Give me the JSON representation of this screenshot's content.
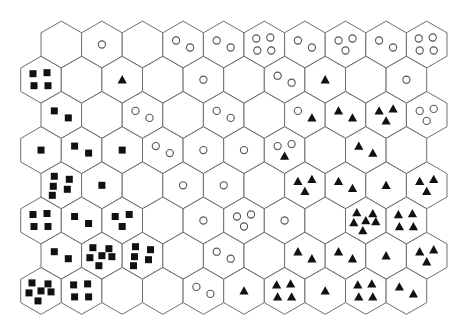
{
  "figure": {
    "type": "hexagonal-som-grid",
    "rows": 8,
    "cols": 10,
    "legend": {
      "square": "class-square",
      "circle": "class-circle",
      "triangle": "class-triangle"
    },
    "colors": {
      "background": "#ffffff",
      "hex_stroke": "#6e6e6e",
      "filled_marker": "#111111",
      "circle_stroke": "#555555"
    },
    "cells": [
      [
        {
          "square": 0,
          "circle": 0,
          "triangle": 0
        },
        {
          "square": 0,
          "circle": 1,
          "triangle": 0
        },
        {
          "square": 0,
          "circle": 0,
          "triangle": 0
        },
        {
          "square": 0,
          "circle": 2,
          "triangle": 0
        },
        {
          "square": 0,
          "circle": 2,
          "triangle": 0
        },
        {
          "square": 0,
          "circle": 4,
          "triangle": 0
        },
        {
          "square": 0,
          "circle": 2,
          "triangle": 0
        },
        {
          "square": 0,
          "circle": 3,
          "triangle": 0
        },
        {
          "square": 0,
          "circle": 2,
          "triangle": 0
        },
        {
          "square": 0,
          "circle": 4,
          "triangle": 0
        }
      ],
      [
        {
          "square": 4,
          "circle": 0,
          "triangle": 0
        },
        {
          "square": 0,
          "circle": 0,
          "triangle": 0
        },
        {
          "square": 0,
          "circle": 0,
          "triangle": 1
        },
        {
          "square": 0,
          "circle": 0,
          "triangle": 0
        },
        {
          "square": 0,
          "circle": 1,
          "triangle": 0
        },
        {
          "square": 0,
          "circle": 0,
          "triangle": 0
        },
        {
          "square": 0,
          "circle": 2,
          "triangle": 0
        },
        {
          "square": 0,
          "circle": 0,
          "triangle": 1
        },
        {
          "square": 0,
          "circle": 0,
          "triangle": 0
        },
        {
          "square": 0,
          "circle": 1,
          "triangle": 0
        }
      ],
      [
        {
          "square": 2,
          "circle": 0,
          "triangle": 0
        },
        {
          "square": 0,
          "circle": 0,
          "triangle": 0
        },
        {
          "square": 0,
          "circle": 2,
          "triangle": 0
        },
        {
          "square": 0,
          "circle": 0,
          "triangle": 0
        },
        {
          "square": 0,
          "circle": 2,
          "triangle": 0
        },
        {
          "square": 0,
          "circle": 0,
          "triangle": 0
        },
        {
          "square": 0,
          "circle": 1,
          "triangle": 1
        },
        {
          "square": 0,
          "circle": 0,
          "triangle": 2
        },
        {
          "square": 0,
          "circle": 0,
          "triangle": 3
        },
        {
          "square": 0,
          "circle": 3,
          "triangle": 0
        }
      ],
      [
        {
          "square": 1,
          "circle": 0,
          "triangle": 0
        },
        {
          "square": 2,
          "circle": 0,
          "triangle": 0
        },
        {
          "square": 1,
          "circle": 0,
          "triangle": 0
        },
        {
          "square": 0,
          "circle": 2,
          "triangle": 0
        },
        {
          "square": 0,
          "circle": 1,
          "triangle": 0
        },
        {
          "square": 0,
          "circle": 1,
          "triangle": 0
        },
        {
          "square": 0,
          "circle": 2,
          "triangle": 1
        },
        {
          "square": 0,
          "circle": 0,
          "triangle": 0
        },
        {
          "square": 0,
          "circle": 0,
          "triangle": 2
        },
        {
          "square": 0,
          "circle": 0,
          "triangle": 0
        }
      ],
      [
        {
          "square": 5,
          "circle": 0,
          "triangle": 0
        },
        {
          "square": 1,
          "circle": 0,
          "triangle": 0
        },
        {
          "square": 0,
          "circle": 0,
          "triangle": 0
        },
        {
          "square": 0,
          "circle": 1,
          "triangle": 0
        },
        {
          "square": 0,
          "circle": 1,
          "triangle": 0
        },
        {
          "square": 0,
          "circle": 0,
          "triangle": 0
        },
        {
          "square": 0,
          "circle": 0,
          "triangle": 3
        },
        {
          "square": 0,
          "circle": 0,
          "triangle": 2
        },
        {
          "square": 0,
          "circle": 0,
          "triangle": 1
        },
        {
          "square": 0,
          "circle": 0,
          "triangle": 3
        }
      ],
      [
        {
          "square": 4,
          "circle": 0,
          "triangle": 0
        },
        {
          "square": 2,
          "circle": 0,
          "triangle": 0
        },
        {
          "square": 3,
          "circle": 0,
          "triangle": 0
        },
        {
          "square": 0,
          "circle": 0,
          "triangle": 0
        },
        {
          "square": 0,
          "circle": 1,
          "triangle": 0
        },
        {
          "square": 0,
          "circle": 3,
          "triangle": 0
        },
        {
          "square": 0,
          "circle": 1,
          "triangle": 0
        },
        {
          "square": 0,
          "circle": 0,
          "triangle": 0
        },
        {
          "square": 0,
          "circle": 0,
          "triangle": 6
        },
        {
          "square": 0,
          "circle": 0,
          "triangle": 4
        }
      ],
      [
        {
          "square": 2,
          "circle": 0,
          "triangle": 0
        },
        {
          "square": 6,
          "circle": 0,
          "triangle": 0
        },
        {
          "square": 5,
          "circle": 0,
          "triangle": 0
        },
        {
          "square": 0,
          "circle": 0,
          "triangle": 0
        },
        {
          "square": 0,
          "circle": 2,
          "triangle": 0
        },
        {
          "square": 0,
          "circle": 0,
          "triangle": 0
        },
        {
          "square": 0,
          "circle": 0,
          "triangle": 2
        },
        {
          "square": 0,
          "circle": 0,
          "triangle": 2
        },
        {
          "square": 0,
          "circle": 0,
          "triangle": 1
        },
        {
          "square": 0,
          "circle": 0,
          "triangle": 3
        }
      ],
      [
        {
          "square": 6,
          "circle": 0,
          "triangle": 0
        },
        {
          "square": 4,
          "circle": 0,
          "triangle": 0
        },
        {
          "square": 0,
          "circle": 0,
          "triangle": 0
        },
        {
          "square": 0,
          "circle": 0,
          "triangle": 0
        },
        {
          "square": 0,
          "circle": 2,
          "triangle": 0
        },
        {
          "square": 0,
          "circle": 0,
          "triangle": 1
        },
        {
          "square": 0,
          "circle": 0,
          "triangle": 4
        },
        {
          "square": 0,
          "circle": 0,
          "triangle": 1
        },
        {
          "square": 0,
          "circle": 0,
          "triangle": 4
        },
        {
          "square": 0,
          "circle": 0,
          "triangle": 2
        }
      ]
    ]
  }
}
